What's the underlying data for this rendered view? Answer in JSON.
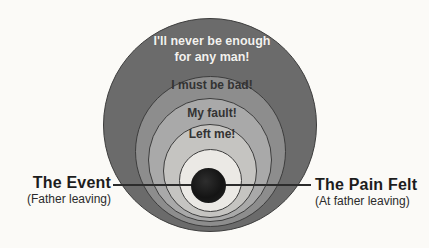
{
  "background_color": "#fbfaf7",
  "diagram": {
    "outline_color": "#3d3d3d",
    "core_dot_color": "#141414",
    "connector_line_color": "#2c2c2c",
    "rings": [
      {
        "id": "ring-1",
        "line1": "I'll never be enough",
        "line2": "for any man!",
        "fill": "#6b6b6b",
        "text_color": "#f3f2ef"
      },
      {
        "id": "ring-2",
        "label": "I must be bad!",
        "fill": "#8d8d8d",
        "text_color": "#333333"
      },
      {
        "id": "ring-3",
        "label": "My fault!",
        "fill": "#a9a9a9",
        "text_color": "#333333"
      },
      {
        "id": "ring-4",
        "label": "Left me!",
        "fill": "#c5c4c1",
        "text_color": "#333333"
      },
      {
        "id": "ring-5",
        "label": "",
        "fill": "#ebe9e5"
      }
    ],
    "labels": {
      "left": {
        "title": "The Event",
        "subtitle": "(Father leaving)"
      },
      "right": {
        "title": "The Pain Felt",
        "subtitle": "(At father leaving)"
      }
    }
  }
}
